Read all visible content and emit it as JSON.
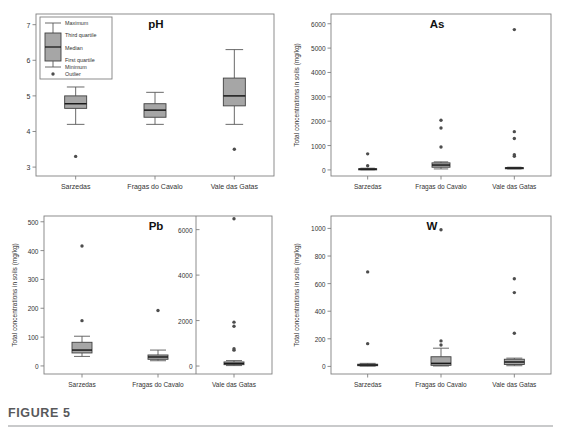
{
  "figure": {
    "caption_label": "FIGURE 5",
    "panel_count": 4
  },
  "legend": {
    "title": "",
    "items": [
      {
        "key": "maximum",
        "label": "Maximum"
      },
      {
        "key": "third-quartile",
        "label": "Third quartile"
      },
      {
        "key": "median",
        "label": "Median"
      },
      {
        "key": "first-quartile",
        "label": "First quartile"
      },
      {
        "key": "minimum",
        "label": "Minimum"
      },
      {
        "key": "outlier",
        "label": "Outlier"
      }
    ]
  },
  "colors": {
    "box_fill": "#a6a6a6",
    "box_stroke": "#404040",
    "median_stroke": "#1a1a1a",
    "whisker_stroke": "#595959",
    "outlier_fill": "#4d4d4d",
    "axis_stroke": "#808080",
    "frame_stroke": "#808080",
    "caption_text": "#58595b",
    "caption_rule": "#c9cacb",
    "background": "#ffffff"
  },
  "axis_labels": {
    "concentration": "Total concentrations in soils (mg/kg)",
    "ph": ""
  },
  "categories": [
    "Sarzedas",
    "Fragas do Cavalo",
    "Vale das Gatas"
  ],
  "chart_data": [
    {
      "id": "ph",
      "type": "box",
      "title": "pH",
      "xlabel": "",
      "ylabel": "",
      "ylim": [
        2.75,
        7.3
      ],
      "yticks": [
        3,
        4,
        5,
        6,
        7
      ],
      "ytick_labels": [
        "3",
        "4",
        "5",
        "6",
        "7"
      ],
      "grid": false,
      "categories": [
        "Sarzedas",
        "Fragas do Cavalo",
        "Vale das Gatas"
      ],
      "boxes": [
        {
          "category": "Sarzedas",
          "min": 4.2,
          "q1": 4.65,
          "median": 4.78,
          "q3": 5.0,
          "max": 5.25,
          "outliers": [
            3.3
          ]
        },
        {
          "category": "Fragas do Cavalo",
          "min": 4.2,
          "q1": 4.4,
          "median": 4.6,
          "q3": 4.78,
          "max": 5.1,
          "outliers": []
        },
        {
          "category": "Vale das Gatas",
          "min": 4.2,
          "q1": 4.72,
          "median": 5.0,
          "q3": 5.5,
          "max": 6.3,
          "outliers": [
            3.5
          ]
        }
      ]
    },
    {
      "id": "as",
      "type": "box",
      "title": "As",
      "xlabel": "",
      "ylabel": "Total concentrations in soils (mg/kg)",
      "ylim": [
        -250,
        6400
      ],
      "yticks": [
        0,
        1000,
        2000,
        3000,
        4000,
        5000,
        6000
      ],
      "ytick_labels": [
        "0",
        "1000",
        "2000",
        "3000",
        "4000",
        "5000",
        "6000"
      ],
      "grid": false,
      "categories": [
        "Sarzedas",
        "Fragas do Cavalo",
        "Vale das Gatas"
      ],
      "boxes": [
        {
          "category": "Sarzedas",
          "min": 5,
          "q1": 15,
          "median": 30,
          "q3": 50,
          "max": 70,
          "outliers": [
            170,
            660
          ]
        },
        {
          "category": "Fragas do Cavalo",
          "min": 40,
          "q1": 110,
          "median": 200,
          "q3": 290,
          "max": 330,
          "outliers": [
            940,
            1720,
            2040
          ]
        },
        {
          "category": "Vale das Gatas",
          "min": 40,
          "q1": 55,
          "median": 75,
          "q3": 95,
          "max": 110,
          "outliers": [
            560,
            620,
            1290,
            1570,
            5760
          ]
        }
      ]
    },
    {
      "id": "pb",
      "type": "box",
      "title": "Pb",
      "xlabel": "",
      "ylabel": "Total concentrations in soils (mg/kg)",
      "ylim": [
        -28,
        520
      ],
      "yticks": [
        0,
        100,
        200,
        300,
        400,
        500
      ],
      "ytick_labels": [
        "0",
        "100",
        "200",
        "300",
        "400",
        "500"
      ],
      "secondary_axis": {
        "applies_to": "Vale das Gatas",
        "ylim": [
          -350,
          6600
        ],
        "yticks": [
          0,
          2000,
          4000,
          6000
        ],
        "ytick_labels": [
          "0",
          "2000",
          "4000",
          "6000"
        ]
      },
      "grid": false,
      "categories": [
        "Sarzedas",
        "Fragas do Cavalo",
        "Vale das Gatas"
      ],
      "boxes": [
        {
          "category": "Sarzedas",
          "min": 33,
          "q1": 45,
          "median": 55,
          "q3": 82,
          "max": 103,
          "outliers": [
            157,
            416
          ],
          "axis": "primary"
        },
        {
          "category": "Fragas do Cavalo",
          "min": 18,
          "q1": 23,
          "median": 31,
          "q3": 38,
          "max": 55,
          "outliers": [
            192
          ],
          "axis": "primary"
        },
        {
          "category": "Vale das Gatas",
          "min": 20,
          "q1": 60,
          "median": 110,
          "q3": 180,
          "max": 240,
          "outliers": [
            700,
            760,
            1750,
            1930,
            6480
          ],
          "axis": "secondary"
        }
      ]
    },
    {
      "id": "w",
      "type": "box",
      "title": "W",
      "xlabel": "",
      "ylabel": "Total concentrations in soils (mg/kg)",
      "ylim": [
        -55,
        1090
      ],
      "yticks": [
        0,
        200,
        400,
        600,
        800,
        1000
      ],
      "ytick_labels": [
        "0",
        "200",
        "400",
        "600",
        "800",
        "1000"
      ],
      "grid": false,
      "categories": [
        "Sarzedas",
        "Fragas do Cavalo",
        "Vale das Gatas"
      ],
      "boxes": [
        {
          "category": "Sarzedas",
          "min": 2,
          "q1": 5,
          "median": 10,
          "q3": 16,
          "max": 22,
          "outliers": [
            165,
            685
          ]
        },
        {
          "category": "Fragas do Cavalo",
          "min": 3,
          "q1": 8,
          "median": 22,
          "q3": 70,
          "max": 132,
          "outliers": [
            155,
            185,
            990
          ]
        },
        {
          "category": "Vale das Gatas",
          "min": 5,
          "q1": 14,
          "median": 32,
          "q3": 52,
          "max": 60,
          "outliers": [
            240,
            535,
            635
          ]
        }
      ]
    }
  ]
}
